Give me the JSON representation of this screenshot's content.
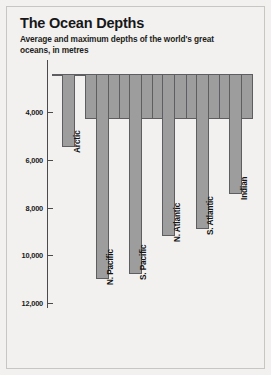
{
  "header": {
    "title": "The Ocean Depths",
    "subtitle": "Average and maximum depths of the world's great oceans, in metres"
  },
  "axis": {
    "ylabel": "",
    "ticks": [
      "4,000",
      "6,000",
      "8,000",
      "10,000",
      "12,000"
    ]
  },
  "bars": [
    {
      "label": "Arctic"
    },
    {
      "label": "N. Pacific"
    },
    {
      "label": "S. Pacific"
    },
    {
      "label": "N. Atlantic"
    },
    {
      "label": "S. Atlantic"
    },
    {
      "label": "Indian"
    }
  ],
  "colors": {
    "background": "#f2f1ef",
    "bar_fill": "#9d9d9d",
    "bar_stroke": "#5e5e60",
    "axis": "#4b4b4d",
    "text": "#17171a"
  },
  "chart_data": {
    "type": "bar",
    "title": "The Ocean Depths",
    "subtitle": "Average and maximum depths of the world's great oceans, in metres",
    "xlabel": "",
    "ylabel": "Depth, metres",
    "orientation": "downward",
    "ylim": [
      2400,
      12100
    ],
    "yticks": [
      4000,
      6000,
      8000,
      10000,
      12000
    ],
    "ytick_labels": [
      "4,000",
      "6,000",
      "8,000",
      "10,000",
      "12,000"
    ],
    "grid": false,
    "legend": "none",
    "categories": [
      "Arctic",
      "N. Pacific",
      "S. Pacific",
      "N. Atlantic",
      "S. Atlantic",
      "Indian"
    ],
    "series": [
      {
        "name": "Average depth",
        "note": "wide band spanning the full bar slot",
        "values": [
          1200,
          4300,
          4300,
          4300,
          4300,
          4300
        ]
      },
      {
        "name": "Maximum depth",
        "note": "narrow column extending to the deepest point",
        "values": [
          5450,
          11000,
          10800,
          9200,
          8900,
          7450
        ]
      }
    ],
    "bar_top_depth": 2400
  }
}
